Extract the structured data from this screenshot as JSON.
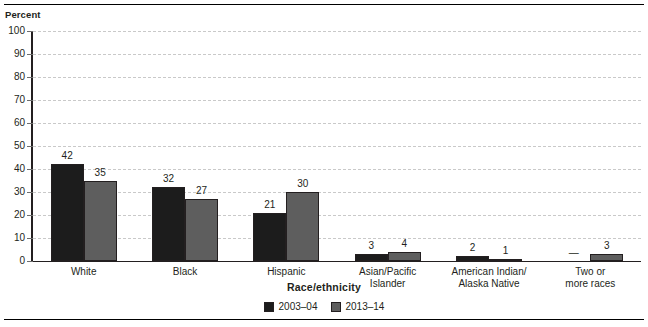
{
  "figure": {
    "y_axis_caption": "Percent",
    "x_axis_title": "Race/ethnicity"
  },
  "legend": {
    "items": [
      {
        "label": "2003–04",
        "color": "#1c1c1c"
      },
      {
        "label": "2013–14",
        "color": "#5e5e5e"
      }
    ]
  },
  "chart_data": {
    "type": "bar",
    "title": "",
    "subtitle": "",
    "xlabel": "Race/ethnicity",
    "ylabel": "Percent",
    "ylim": [
      0,
      100
    ],
    "yticks": [
      0,
      10,
      20,
      30,
      40,
      50,
      60,
      70,
      80,
      90,
      100
    ],
    "ytick_labels": [
      "0",
      "10",
      "20",
      "30",
      "40",
      "50",
      "60",
      "70",
      "80",
      "90",
      "100"
    ],
    "grid": "horizontal-dashed",
    "legend_position": "bottom-center",
    "categories": [
      "White",
      "Black",
      "Hispanic",
      "Asian/Pacific Islander",
      "American Indian/ Alaska Native",
      "Two or more races"
    ],
    "category_lines": [
      [
        "White"
      ],
      [
        "Black"
      ],
      [
        "Hispanic"
      ],
      [
        "Asian/Pacific",
        "Islander"
      ],
      [
        "American Indian/",
        "Alaska Native"
      ],
      [
        "Two or",
        "more races"
      ]
    ],
    "series": [
      {
        "name": "2003–04",
        "color": "#1c1c1c",
        "values": [
          42,
          32,
          21,
          3,
          2,
          null
        ],
        "labels": [
          "42",
          "32",
          "21",
          "3",
          "2",
          "—"
        ]
      },
      {
        "name": "2013–14",
        "color": "#5e5e5e",
        "values": [
          35,
          27,
          30,
          4,
          1,
          3
        ],
        "labels": [
          "35",
          "27",
          "30",
          "4",
          "1",
          "3"
        ]
      }
    ]
  }
}
